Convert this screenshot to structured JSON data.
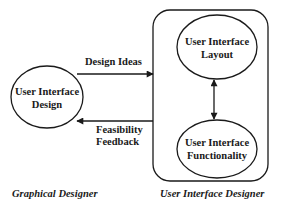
{
  "diagram": {
    "type": "flow",
    "colors": {
      "ink": "#1a1a1a",
      "background": "#ffffff"
    },
    "nodes": [
      {
        "id": "ui-design",
        "shape": "ellipse",
        "lines": [
          "User Interface",
          "Design"
        ]
      },
      {
        "id": "ui-layout",
        "shape": "ellipse",
        "lines": [
          "User Interface",
          "Layout"
        ]
      },
      {
        "id": "ui-functionality",
        "shape": "ellipse",
        "lines": [
          "User Interface",
          "Functionality"
        ]
      }
    ],
    "groups": [
      {
        "id": "ui-designer-group",
        "shape": "rounded-rectangle",
        "contains": [
          "ui-layout",
          "ui-functionality"
        ],
        "label": "User Interface Designer"
      }
    ],
    "edges": [
      {
        "from": "ui-design",
        "to": "ui-designer-group",
        "label_lines": [
          "Design Ideas"
        ],
        "direction": "forward"
      },
      {
        "from": "ui-designer-group",
        "to": "ui-design",
        "label_lines": [
          "Feasibility",
          "Feedback"
        ],
        "direction": "forward"
      },
      {
        "from": "ui-layout",
        "to": "ui-functionality",
        "label_lines": [],
        "direction": "bidirectional"
      }
    ],
    "roles": {
      "left": "Graphical Designer",
      "right": "User Interface Designer"
    }
  }
}
